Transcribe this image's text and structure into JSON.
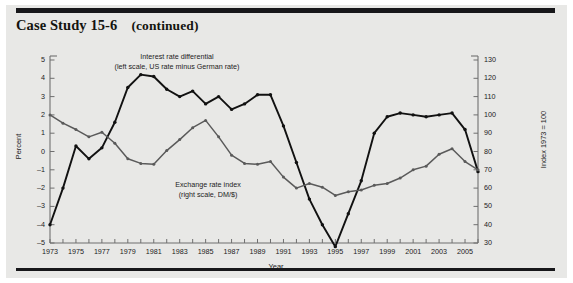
{
  "header": {
    "case_study_title": "Case Study 15-6",
    "continued_label": "(continued)"
  },
  "annotations": {
    "interest_line1": "Interest rate differential",
    "interest_line2": "(left scale, US rate minus German rate)",
    "exchange_line1": "Exchange rate index",
    "exchange_line2": "(right scale, DM/$)"
  },
  "chart_data": {
    "type": "line",
    "xlabel": "Year",
    "ylabel": "Percent",
    "y2label": "Index 1973 = 100",
    "xlim": [
      1973,
      2006
    ],
    "ylim": [
      -5,
      5
    ],
    "y2lim": [
      30,
      130
    ],
    "grid": false,
    "legend": "inline-annotations",
    "x": [
      1973,
      1974,
      1975,
      1976,
      1977,
      1978,
      1979,
      1980,
      1981,
      1982,
      1983,
      1984,
      1985,
      1986,
      1987,
      1988,
      1989,
      1990,
      1991,
      1992,
      1993,
      1994,
      1995,
      1996,
      1997,
      1998,
      1999,
      2000,
      2001,
      2002,
      2003,
      2004,
      2005,
      2006
    ],
    "xticks": [
      1973,
      1975,
      1977,
      1979,
      1981,
      1983,
      1985,
      1987,
      1989,
      1991,
      1993,
      1995,
      1997,
      1999,
      2001,
      2003,
      2005
    ],
    "yticks": [
      -5,
      -4,
      -3,
      -2,
      -1,
      0,
      1,
      2,
      3,
      4,
      5
    ],
    "y2ticks": [
      30,
      40,
      50,
      60,
      70,
      80,
      90,
      100,
      110,
      120,
      130
    ],
    "series": [
      {
        "name": "Interest rate differential",
        "axis": "left",
        "units": "Percent",
        "color": "#111111",
        "marker": "circle",
        "values": [
          -4.0,
          -2.0,
          0.3,
          -0.4,
          0.2,
          1.6,
          3.5,
          4.2,
          4.1,
          3.4,
          3.0,
          3.3,
          2.6,
          3.0,
          2.3,
          2.6,
          3.1,
          3.1,
          1.4,
          -0.6,
          -2.6,
          -4.0,
          -5.2,
          -3.4,
          -1.6,
          1.0,
          1.9,
          2.1,
          2.0,
          1.9,
          2.0,
          2.1,
          1.2,
          -1.1
        ]
      },
      {
        "name": "Exchange rate index",
        "axis": "right",
        "units": "Index 1973 = 100",
        "color": "#5a5a5a",
        "marker": "circle",
        "values": [
          100.0,
          95.5,
          92.0,
          88.0,
          90.5,
          84.5,
          76.0,
          73.5,
          73.0,
          80.5,
          86.5,
          93.0,
          97.0,
          88.0,
          78.0,
          73.5,
          73.0,
          74.5,
          66.0,
          60.0,
          62.5,
          60.5,
          56.0,
          58.0,
          59.0,
          61.5,
          62.5,
          65.5,
          70.0,
          72.0,
          78.5,
          81.5,
          74.5,
          70.0
        ]
      }
    ],
    "note_interest": "Interest rate differential (left scale, US rate minus German rate)",
    "note_exchange": "Exchange rate index (right scale, DM/$)"
  },
  "axes": {
    "left_title": "Percent",
    "right_title": "Index 1973 = 100",
    "x_title": "Year"
  }
}
